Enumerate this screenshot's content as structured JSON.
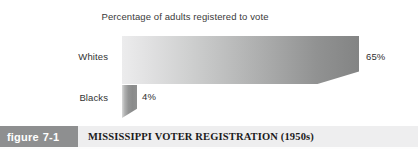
{
  "figure": {
    "tag_word": "figure",
    "tag_number": "7-1",
    "caption": "MISSISSIPPI VOTER REGISTRATION (1950s)",
    "tag_bg_color": "#8e8f90",
    "caption_band_color": "#eeeeef"
  },
  "chart_data": {
    "type": "bar",
    "orientation": "horizontal",
    "title": "Percentage of adults registered to vote",
    "xlabel": "",
    "ylabel": "",
    "categories": [
      "Whites",
      "Blacks"
    ],
    "values": [
      65,
      4
    ],
    "value_labels": [
      "65%",
      "4%"
    ],
    "xlim": [
      0,
      70
    ],
    "grid": false,
    "legend": null,
    "series": [
      {
        "name": "Percentage of adults registered to vote",
        "values": [
          65,
          4
        ]
      }
    ],
    "style": {
      "bar_fill_start": "#ececed",
      "bar_fill_end": "#838484",
      "bar_effect": "3d-beveled-slab"
    }
  }
}
